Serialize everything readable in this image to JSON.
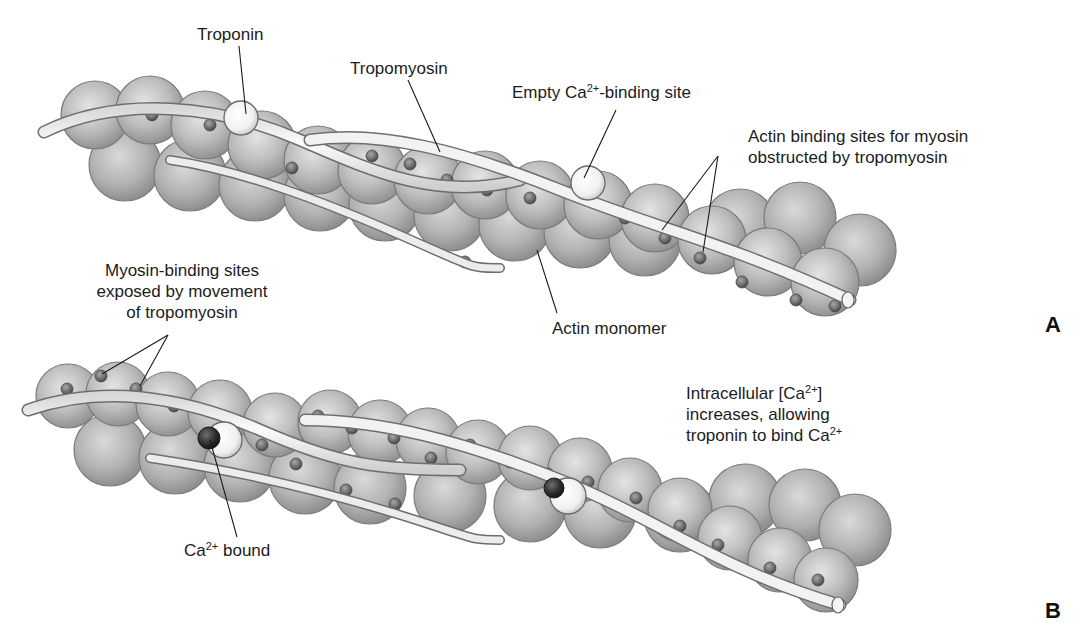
{
  "figure": {
    "panels": [
      {
        "id": "A",
        "letter": "A",
        "caption_state": "Relaxed: tropomyosin covers myosin-binding sites",
        "labels": {
          "troponin": "Troponin",
          "tropomyosin": "Tropomyosin",
          "empty_site_pre": "Empty Ca",
          "empty_site_sup": "2+",
          "empty_site_post": "-binding site",
          "actin_sites_line1": "Actin binding sites for myosin",
          "actin_sites_line2": "obstructed by tropomyosin",
          "actin_monomer": "Actin monomer"
        }
      },
      {
        "id": "B",
        "letter": "B",
        "caption_state": "Activated: Ca2+ bound to troponin, sites exposed",
        "labels": {
          "myosin_sites_line1": "Myosin-binding sites",
          "myosin_sites_line2": "exposed by movement",
          "myosin_sites_line3": "of tropomyosin",
          "intracellular_line1_pre": "Intracellular [Ca",
          "intracellular_line1_sup": "2+",
          "intracellular_line1_post": "]",
          "intracellular_line2": "increases, allowing",
          "intracellular_line3_pre": "troponin to bind Ca",
          "intracellular_line3_sup": "2+",
          "ca_bound_pre": "Ca",
          "ca_bound_sup": "2+",
          "ca_bound_post": " bound"
        }
      }
    ],
    "colors": {
      "actin_fill": "#b8b8b8",
      "actin_edge": "#7a7a7a",
      "actin_highlight": "#e2e2e2",
      "tropomyosin_fill": "#eeeeee",
      "tropomyosin_edge": "#6e6e6e",
      "binding_site": "#6a6a6a",
      "troponin_fill": "#f6f6f6",
      "calcium_bound": "#2c2c2c",
      "leader_line": "#1a1a1a"
    }
  }
}
